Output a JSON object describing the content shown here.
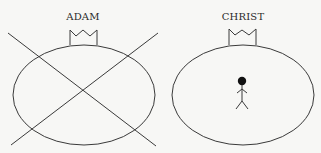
{
  "diagram": {
    "colors": {
      "background": "#f7f7f5",
      "line": "#3a3a3a",
      "text": "#2a2a2a",
      "figure": "#111111"
    },
    "top_cropped_text": "",
    "panels": [
      {
        "id": "adam",
        "label": "ADAM",
        "shape": "ellipse",
        "has_crown": true,
        "crossed_out": true,
        "contains_figure": false
      },
      {
        "id": "christ",
        "label": "CHRIST",
        "shape": "ellipse",
        "has_crown": true,
        "crossed_out": false,
        "contains_figure": true,
        "figure": "stick-figure"
      }
    ]
  }
}
